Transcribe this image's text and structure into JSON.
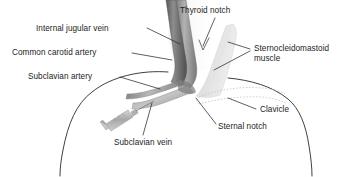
{
  "figure": {
    "background_color": "#ffffff",
    "width": 360,
    "height": 177
  },
  "labels": {
    "internal_jugular_vein": "Internal jugular vein",
    "common_carotid_artery": "Common carotid artery",
    "subclavian_artery": "Subclavian artery",
    "thyroid_notch": "Thyroid notch",
    "sternocleidomastoid_muscle": "Sternocleidomastoid muscle",
    "clavicle": "Clavicle",
    "sternal_notch": "Sternal notch",
    "subclavian_vein": "Subclavian vein"
  },
  "structures": [
    {
      "name": "internal-jugular-vein",
      "kind": "vessel",
      "color": "#8a8a8a"
    },
    {
      "name": "common-carotid-artery",
      "kind": "vessel",
      "color": "#6f6f6f"
    },
    {
      "name": "subclavian-artery",
      "kind": "vessel",
      "color": "#8f8f8f"
    },
    {
      "name": "subclavian-vein",
      "kind": "vessel",
      "color": "#9a9a9a"
    },
    {
      "name": "sternocleidomastoid-muscle",
      "kind": "muscle",
      "color": "#e2e2e2"
    },
    {
      "name": "clavicle",
      "kind": "bone-outline",
      "color": "#bcbcbc"
    },
    {
      "name": "body-outline",
      "kind": "outline",
      "color": "#2a2a2a"
    },
    {
      "name": "syringe",
      "kind": "instrument",
      "color": "#b5b5b5"
    }
  ],
  "colors": {
    "text": "#1c1c1c",
    "leader_line": "#2a2a2a",
    "outline": "#2a2a2a",
    "vessel_dark": "#6f6f6f",
    "vessel_mid": "#9a9a9a",
    "muscle_fill": "#e6e6e6",
    "bone_dotted": "#bfbfbf",
    "syringe": "#b5b5b5"
  }
}
